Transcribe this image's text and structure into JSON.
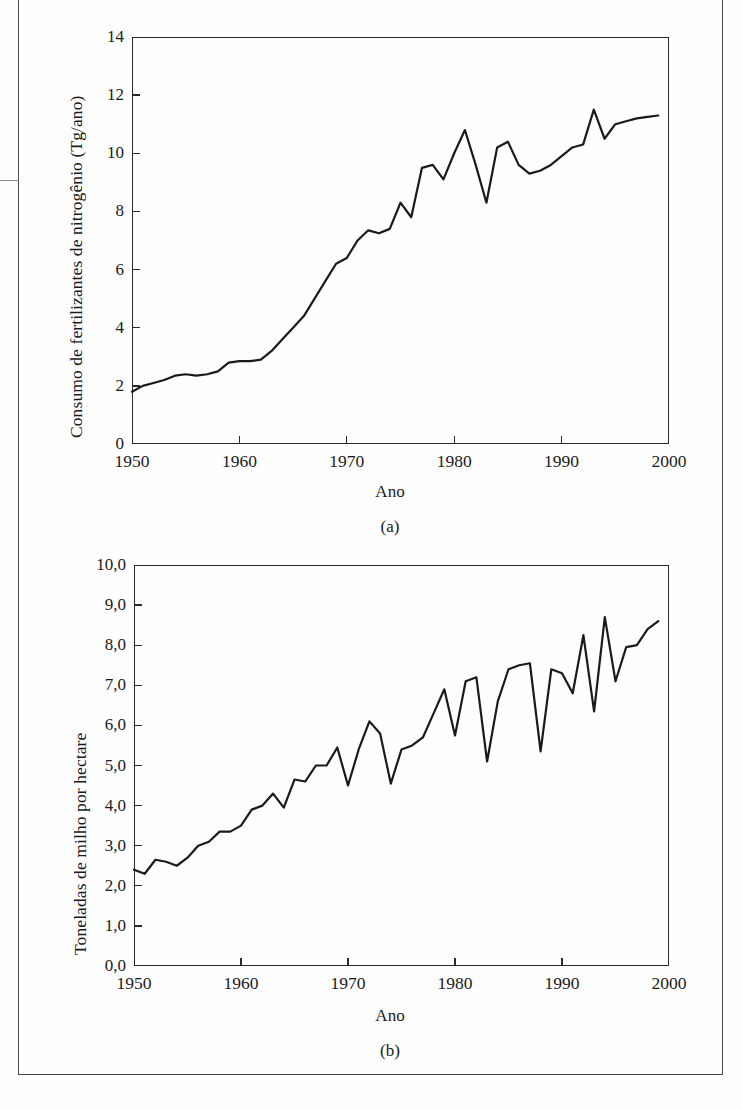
{
  "figure": {
    "panels": [
      {
        "id": "a",
        "caption": "(a)",
        "xlabel": "Ano",
        "ylabel": "Consumo de fertilizantes de nitrogênio (Tg/ano)",
        "ytick_labels": [
          "14",
          "12",
          "10",
          "8",
          "6",
          "4",
          "2",
          "0"
        ],
        "xtick_labels": [
          "1950",
          "1960",
          "1970",
          "1980",
          "1990",
          "2000"
        ]
      },
      {
        "id": "b",
        "caption": "(b)",
        "xlabel": "Ano",
        "ylabel": "Toneladas de milho por hectare",
        "ytick_labels": [
          "10,0",
          "9,0",
          "8,0",
          "7,0",
          "6,0",
          "5,0",
          "4,0",
          "3,0",
          "2,0",
          "1,0",
          "0,0"
        ],
        "xtick_labels": [
          "1950",
          "1960",
          "1970",
          "1980",
          "1990",
          "2000"
        ]
      }
    ],
    "line_color": "#1a1a1a"
  },
  "chart_data": [
    {
      "type": "line",
      "panel": "a",
      "title": "",
      "xlabel": "Ano",
      "ylabel": "Consumo de fertilizantes de nitrogênio (Tg/ano)",
      "xlim": [
        1950,
        2000
      ],
      "ylim": [
        0,
        14
      ],
      "yticks": [
        0,
        2,
        4,
        6,
        8,
        10,
        12,
        14
      ],
      "xticks": [
        1950,
        1960,
        1970,
        1980,
        1990,
        2000
      ],
      "grid": false,
      "legend": null,
      "x": [
        1950,
        1951,
        1952,
        1953,
        1954,
        1955,
        1956,
        1957,
        1958,
        1959,
        1960,
        1961,
        1962,
        1963,
        1964,
        1965,
        1966,
        1967,
        1968,
        1969,
        1970,
        1971,
        1972,
        1973,
        1974,
        1975,
        1976,
        1977,
        1978,
        1979,
        1980,
        1981,
        1982,
        1983,
        1984,
        1985,
        1986,
        1987,
        1988,
        1989,
        1990,
        1991,
        1992,
        1993,
        1994,
        1995,
        1996,
        1997,
        1998,
        1999
      ],
      "values": [
        1.8,
        2.0,
        2.1,
        2.2,
        2.35,
        2.4,
        2.35,
        2.4,
        2.5,
        2.8,
        2.85,
        2.85,
        2.9,
        3.2,
        3.6,
        4.0,
        4.4,
        5.0,
        5.6,
        6.2,
        6.4,
        7.0,
        7.35,
        7.25,
        7.4,
        8.3,
        7.8,
        9.5,
        9.6,
        9.1,
        10.0,
        10.8,
        9.6,
        8.3,
        10.2,
        10.4,
        9.6,
        9.3,
        9.4,
        9.6,
        9.9,
        10.2,
        10.3,
        11.5,
        10.5,
        11.0,
        11.1,
        11.2,
        11.25,
        11.3
      ]
    },
    {
      "type": "line",
      "panel": "b",
      "title": "",
      "xlabel": "Ano",
      "ylabel": "Toneladas de milho por hectare",
      "xlim": [
        1950,
        2000
      ],
      "ylim": [
        0.0,
        10.0
      ],
      "yticks": [
        0.0,
        1.0,
        2.0,
        3.0,
        4.0,
        5.0,
        6.0,
        7.0,
        8.0,
        9.0,
        10.0
      ],
      "xticks": [
        1950,
        1960,
        1970,
        1980,
        1990,
        2000
      ],
      "grid": false,
      "legend": null,
      "x": [
        1950,
        1951,
        1952,
        1953,
        1954,
        1955,
        1956,
        1957,
        1958,
        1959,
        1960,
        1961,
        1962,
        1963,
        1964,
        1965,
        1966,
        1967,
        1968,
        1969,
        1970,
        1971,
        1972,
        1973,
        1974,
        1975,
        1976,
        1977,
        1978,
        1979,
        1980,
        1981,
        1982,
        1983,
        1984,
        1985,
        1986,
        1987,
        1988,
        1989,
        1990,
        1991,
        1992,
        1993,
        1994,
        1995,
        1996,
        1997,
        1998,
        1999
      ],
      "values": [
        2.4,
        2.3,
        2.65,
        2.6,
        2.5,
        2.7,
        3.0,
        3.1,
        3.35,
        3.35,
        3.5,
        3.9,
        4.0,
        4.3,
        3.95,
        4.65,
        4.6,
        5.0,
        5.0,
        5.45,
        4.5,
        5.4,
        6.1,
        5.8,
        4.55,
        5.4,
        5.5,
        5.7,
        6.3,
        6.9,
        5.75,
        7.1,
        7.2,
        5.1,
        6.6,
        7.4,
        7.5,
        7.55,
        5.35,
        7.4,
        7.3,
        6.8,
        8.25,
        6.35,
        8.7,
        7.1,
        7.95,
        8.0,
        8.4,
        8.6
      ]
    }
  ]
}
